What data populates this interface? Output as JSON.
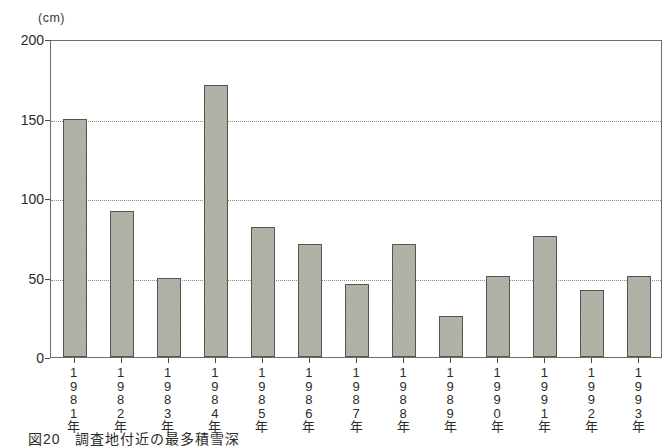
{
  "chart_data": {
    "type": "bar",
    "title": "",
    "unit_label": "(cm)",
    "xlabel": "",
    "ylabel": "",
    "ylim": [
      0,
      200
    ],
    "yticks": [
      0,
      50,
      100,
      150,
      200
    ],
    "grid": true,
    "legend": "none",
    "categories": [
      "1981年",
      "1982年",
      "1983年",
      "1984年",
      "1985年",
      "1986年",
      "1987年",
      "1988年",
      "1989年",
      "1990年",
      "1991年",
      "1992年",
      "1993年"
    ],
    "category_chars": [
      [
        "1",
        "9",
        "8",
        "1",
        "年"
      ],
      [
        "1",
        "9",
        "8",
        "2",
        "年"
      ],
      [
        "1",
        "9",
        "8",
        "3",
        "年"
      ],
      [
        "1",
        "9",
        "8",
        "4",
        "年"
      ],
      [
        "1",
        "9",
        "8",
        "5",
        "年"
      ],
      [
        "1",
        "9",
        "8",
        "6",
        "年"
      ],
      [
        "1",
        "9",
        "8",
        "7",
        "年"
      ],
      [
        "1",
        "9",
        "8",
        "8",
        "年"
      ],
      [
        "1",
        "9",
        "8",
        "9",
        "年"
      ],
      [
        "1",
        "9",
        "9",
        "0",
        "年"
      ],
      [
        "1",
        "9",
        "9",
        "1",
        "年"
      ],
      [
        "1",
        "9",
        "9",
        "2",
        "年"
      ],
      [
        "1",
        "9",
        "9",
        "3",
        "年"
      ]
    ],
    "values": [
      150,
      92,
      50,
      171,
      82,
      71,
      46,
      71,
      26,
      51,
      76,
      42,
      51
    ],
    "bar_fill_color": "#b7b7ad",
    "bar_border_color": "#55554e",
    "axis_color": "#6e6e66",
    "grid_color": "#8d8d84"
  },
  "caption": {
    "number": "図20",
    "text": "調査地付近の最多積雪深"
  }
}
